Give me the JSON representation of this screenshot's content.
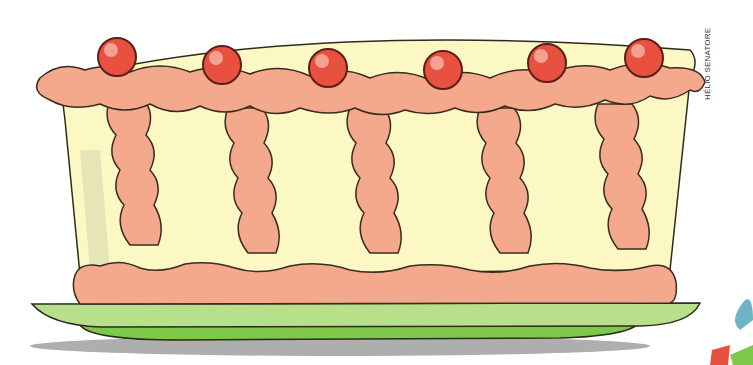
{
  "illustration": {
    "subject": "cake-on-plate",
    "credit": "HÉLIO SENATORE",
    "colors": {
      "cake_body": "#fbf8c4",
      "cake_shadow": "#d8d8b0",
      "frosting": "#f4a98c",
      "frosting_highlight": "#fbd2c2",
      "cherry": "#e8513f",
      "cherry_highlight": "#f5a090",
      "plate_top": "#b8e08a",
      "plate_bottom": "#7ec84a",
      "shadow": "#9a9a9a",
      "outline": "#3a2a20"
    },
    "cherries": [
      {
        "cx": 117,
        "cy": 57
      },
      {
        "cx": 222,
        "cy": 65
      },
      {
        "cx": 328,
        "cy": 68
      },
      {
        "cx": 443,
        "cy": 70
      },
      {
        "cx": 547,
        "cy": 63
      },
      {
        "cx": 644,
        "cy": 58
      }
    ],
    "pillars": [
      {
        "x": 125
      },
      {
        "x": 243
      },
      {
        "x": 367
      },
      {
        "x": 490
      },
      {
        "x": 610
      }
    ]
  }
}
